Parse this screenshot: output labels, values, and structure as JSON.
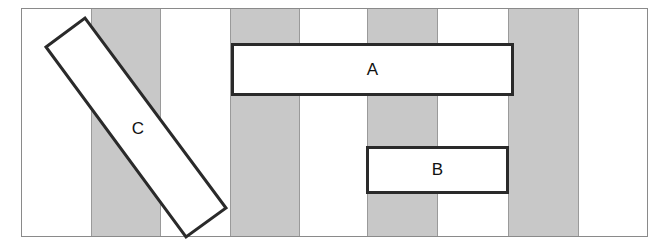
{
  "diagram": {
    "frame": {
      "x": 21,
      "y": 8,
      "width": 627,
      "height": 229,
      "border_color": "#8a8a8a"
    },
    "stripes": [
      {
        "x": 91,
        "width": 70
      },
      {
        "x": 230,
        "width": 70
      },
      {
        "x": 367,
        "width": 71
      },
      {
        "x": 508,
        "width": 71
      }
    ],
    "stripe_color": "#c8c8c8",
    "rectangles": [
      {
        "id": "A",
        "label": "A",
        "x": 231,
        "y": 43,
        "width": 283,
        "height": 53
      },
      {
        "id": "B",
        "label": "B",
        "x": 366,
        "y": 146,
        "width": 143,
        "height": 48
      },
      {
        "id": "C",
        "label": "C",
        "rotated": true,
        "corners": [
          [
            46,
            47
          ],
          [
            85,
            18
          ],
          [
            226,
            208
          ],
          [
            186,
            237
          ]
        ]
      }
    ]
  }
}
